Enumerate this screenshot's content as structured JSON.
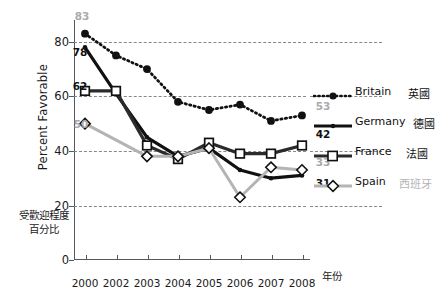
{
  "chart_data": {
    "type": "line",
    "title": "",
    "xlabel": "年份",
    "ylabel": "Percent Favorable",
    "ylabel_cn_line1": "受歡迎程度",
    "ylabel_cn_line2": "百分比",
    "categories": [
      "2000",
      "2002",
      "2003",
      "2004",
      "2005",
      "2006",
      "2007",
      "2008"
    ],
    "ylim": [
      0,
      88
    ],
    "yticks": [
      0,
      20,
      40,
      60,
      80
    ],
    "grid": "horizontal-dashed",
    "legend_position": "right",
    "series": [
      {
        "name": "Britain",
        "name_cn": "英國",
        "style": "dotted",
        "marker": "filled-circle",
        "color": "#111111",
        "values": [
          83,
          75,
          70,
          58,
          55,
          57,
          51,
          53
        ],
        "start_label": "83",
        "end_label": "53"
      },
      {
        "name": "Germany",
        "name_cn": "德國",
        "style": "solid-thick",
        "marker": "small-filled",
        "color": "#111111",
        "values": [
          78,
          61,
          45,
          38,
          41,
          33,
          30,
          31
        ],
        "start_label": "78",
        "end_label": "31"
      },
      {
        "name": "France",
        "name_cn": "法國",
        "style": "solid-thick",
        "marker": "open-square",
        "color": "#2b2b2b",
        "values": [
          62,
          62,
          42,
          37,
          43,
          39,
          39,
          42
        ],
        "start_label": "62",
        "end_label": "42"
      },
      {
        "name": "Spain",
        "name_cn": "西班牙",
        "style": "solid-gray",
        "marker": "open-diamond",
        "color": "#b4b4b4",
        "values": [
          50,
          null,
          38,
          38,
          41,
          23,
          34,
          33
        ],
        "start_label": "50",
        "end_label": "33"
      }
    ],
    "annotations": [
      {
        "text": "83",
        "series": "Britain",
        "position": "left-start",
        "color": "#a9a9a9"
      },
      {
        "text": "78",
        "series": "Germany",
        "position": "left-start",
        "color": "#111111"
      },
      {
        "text": "62",
        "series": "France",
        "position": "left-start",
        "color": "#111111"
      },
      {
        "text": "50",
        "series": "Spain",
        "position": "left-start",
        "color": "#a9a9a9"
      },
      {
        "text": "53",
        "series": "Britain",
        "position": "right-end",
        "color": "#a9a9a9"
      },
      {
        "text": "42",
        "series": "France",
        "position": "right-end",
        "color": "#111111"
      },
      {
        "text": "33",
        "series": "Spain",
        "position": "right-end",
        "color": "#a9a9a9"
      },
      {
        "text": "31",
        "series": "Germany",
        "position": "right-end",
        "color": "#111111"
      }
    ]
  },
  "axis": {
    "y_ticks": [
      "0",
      "20",
      "40",
      "60",
      "80"
    ],
    "x_ticks": [
      "2000",
      "2002",
      "2003",
      "2004",
      "2005",
      "2006",
      "2007",
      "2008"
    ],
    "y_title": "Percent Favorable",
    "x_title": "年份",
    "cn_caption_line1": "受歡迎程度",
    "cn_caption_line2": "百分比"
  },
  "legend": {
    "items": [
      {
        "label": "Britain",
        "label_cn": "英國",
        "icon": "dotted-line-filled-circle-icon"
      },
      {
        "label": "Germany",
        "label_cn": "德國",
        "icon": "solid-line-dot-icon"
      },
      {
        "label": "France",
        "label_cn": "法國",
        "icon": "solid-line-open-square-icon"
      },
      {
        "label": "Spain",
        "label_cn": "西班牙",
        "icon": "gray-line-open-diamond-icon"
      }
    ]
  },
  "labels": {
    "b83": "83",
    "g78": "78",
    "f62": "62",
    "s50": "50",
    "b53": "53",
    "f42": "42",
    "s33": "33",
    "g31": "31"
  }
}
